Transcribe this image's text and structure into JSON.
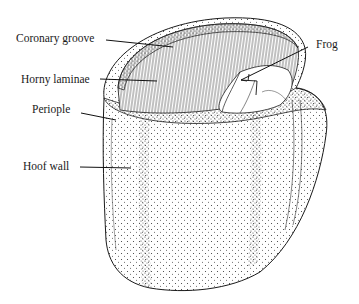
{
  "diagram": {
    "labels": [
      {
        "id": "coronary-groove",
        "text": "Coronary groove",
        "x": 16,
        "y": 33
      },
      {
        "id": "horny-laminae",
        "text": "Horny laminae",
        "x": 21,
        "y": 74
      },
      {
        "id": "periople",
        "text": "Periople",
        "x": 32,
        "y": 104
      },
      {
        "id": "hoof-wall",
        "text": "Hoof wall",
        "x": 23,
        "y": 161
      },
      {
        "id": "frog",
        "text": "Frog",
        "x": 316,
        "y": 39
      }
    ],
    "colors": {
      "ink": "#1a1a1a",
      "background": "#ffffff"
    }
  }
}
